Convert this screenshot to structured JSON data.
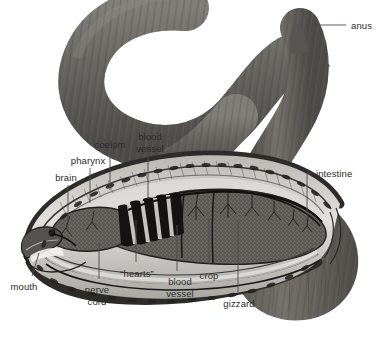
{
  "figure": {
    "background_color": "#ffffff",
    "body_color": "#6b6a66",
    "body_color_dark": "#4a4845",
    "body_color_light": "#8e8c87",
    "coelom_color": "#c9c8c4",
    "organ_color": "#6f6e6a",
    "line_color": "#4a4a4a",
    "text_color": "#2b2b2b"
  },
  "labels": [
    {
      "id": "anus",
      "text": "anus",
      "x": 351,
      "y": 20,
      "align": "lft",
      "leader": {
        "x1": 313,
        "y1": 25,
        "x2": 346,
        "y2": 25
      }
    },
    {
      "id": "coelom",
      "text": "coelom",
      "x": 110,
      "y": 139,
      "align": "ctr",
      "leader": {
        "x1": 110,
        "y1": 152,
        "x2": 110,
        "y2": 190
      }
    },
    {
      "id": "blood-vessel-top",
      "text": "blood\nvessel",
      "x": 150,
      "y": 131,
      "align": "ctr",
      "leader": {
        "x1": 148,
        "y1": 156,
        "x2": 148,
        "y2": 199
      }
    },
    {
      "id": "pharynx",
      "text": "pharynx",
      "x": 88,
      "y": 155,
      "align": "ctr",
      "leader": {
        "x1": 90,
        "y1": 168,
        "x2": 90,
        "y2": 203
      }
    },
    {
      "id": "brain",
      "text": "brain",
      "x": 66,
      "y": 172,
      "align": "ctr",
      "leader": {
        "x1": 68,
        "y1": 185,
        "x2": 68,
        "y2": 222
      }
    },
    {
      "id": "intestine",
      "text": "intestine",
      "x": 316,
      "y": 168,
      "align": "lft",
      "leader": {
        "x1": 307,
        "y1": 173,
        "x2": 312,
        "y2": 173
      },
      "leader2": {
        "x1": 307,
        "y1": 173,
        "x2": 307,
        "y2": 224
      }
    },
    {
      "id": "mouth",
      "text": "mouth",
      "x": 24,
      "y": 281,
      "align": "ctr",
      "leader": {
        "x1": 39,
        "y1": 253,
        "x2": 32,
        "y2": 276
      }
    },
    {
      "id": "nerve-cord",
      "text": "nerve\ncord",
      "x": 97,
      "y": 284,
      "align": "ctr",
      "leader": {
        "x1": 99,
        "y1": 243,
        "x2": 99,
        "y2": 279
      }
    },
    {
      "id": "hearts",
      "text": "“hearts”",
      "x": 137,
      "y": 268,
      "align": "ctr",
      "leader": {
        "x1": 136,
        "y1": 220,
        "x2": 136,
        "y2": 262
      }
    },
    {
      "id": "blood-vessel-bottom",
      "text": "blood\nvessel",
      "x": 180,
      "y": 276,
      "align": "ctr",
      "leader": {
        "x1": 177,
        "y1": 225,
        "x2": 177,
        "y2": 271
      }
    },
    {
      "id": "crop",
      "text": "crop",
      "x": 209,
      "y": 270,
      "align": "ctr",
      "leader": {
        "x1": 209,
        "y1": 218,
        "x2": 209,
        "y2": 264
      }
    },
    {
      "id": "gizzard",
      "text": "gizzard",
      "x": 239,
      "y": 298,
      "align": "ctr",
      "leader": {
        "x1": 238,
        "y1": 220,
        "x2": 238,
        "y2": 292
      }
    }
  ]
}
